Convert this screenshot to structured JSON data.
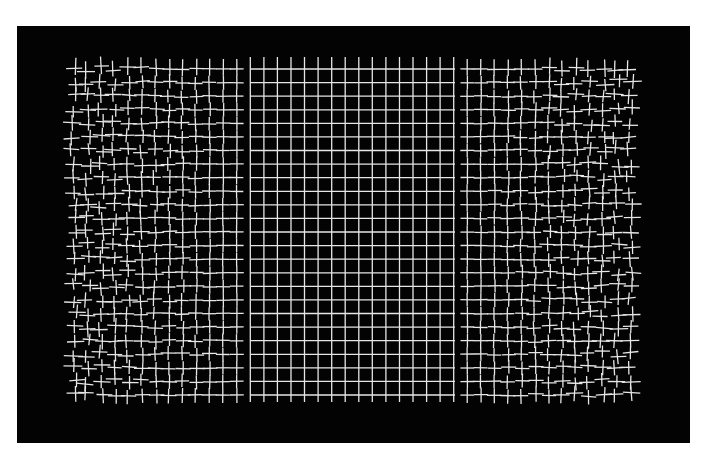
{
  "image": {
    "width": 708,
    "height": 466,
    "background": "#ffffff",
    "frame": {
      "x": 17,
      "y": 26,
      "width": 673,
      "height": 417,
      "color": "#030303"
    },
    "grid": {
      "x0": 74,
      "y0": 69,
      "x1": 630,
      "y1": 395,
      "columns": 42,
      "rows": 25,
      "line_color": "#e6e6e6",
      "distorted_regions": [
        {
          "x_from": 74,
          "x_to": 250,
          "strength": "high-at-edge"
        },
        {
          "x_from": 455,
          "x_to": 630,
          "strength": "high-at-edge"
        }
      ],
      "vertical_line_extension_top": 57,
      "vertical_line_extension_bottom": 402
    },
    "description": "Black rectangle with white square grid; grid lines are straight in the center and increasingly jittered/broken into crosses toward left and right edges"
  }
}
